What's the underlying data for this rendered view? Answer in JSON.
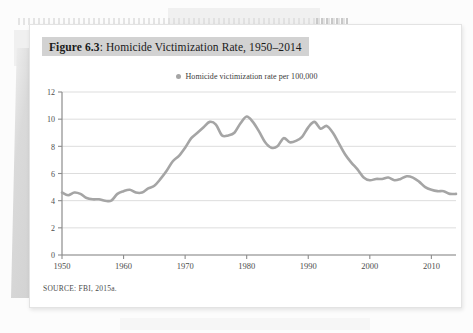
{
  "figure": {
    "label": "Figure 6.3",
    "title_rest": ": Homicide Victimization Rate, 1950–2014",
    "source": "SOURCE: FBI, 2015a."
  },
  "legend": {
    "marker": "circle-marker",
    "text": "Homicide victimization rate per 100,000"
  },
  "colors": {
    "line": "#a5a5a5",
    "grid": "#d9d9d9",
    "axis": "#8c8c8c",
    "title_band": "#d2d2d2",
    "card": "#ffffff",
    "page": "#fcfcfc"
  },
  "chart_data": {
    "type": "line",
    "title": "Figure 6.3: Homicide Victimization Rate, 1950–2014",
    "xlabel": "",
    "ylabel": "",
    "ylim": [
      0,
      12
    ],
    "xlim": [
      1950,
      2014
    ],
    "yticks": [
      0,
      2,
      4,
      6,
      8,
      10,
      12
    ],
    "xticks": [
      1950,
      1960,
      1970,
      1980,
      1990,
      2000,
      2010
    ],
    "grid": true,
    "legend_position": "top-center",
    "series": [
      {
        "name": "Homicide victimization rate per 100,000",
        "x": [
          1950,
          1951,
          1952,
          1953,
          1954,
          1955,
          1956,
          1957,
          1958,
          1959,
          1960,
          1961,
          1962,
          1963,
          1964,
          1965,
          1966,
          1967,
          1968,
          1969,
          1970,
          1971,
          1972,
          1973,
          1974,
          1975,
          1976,
          1977,
          1978,
          1979,
          1980,
          1981,
          1982,
          1983,
          1984,
          1985,
          1986,
          1987,
          1988,
          1989,
          1990,
          1991,
          1992,
          1993,
          1994,
          1995,
          1996,
          1997,
          1998,
          1999,
          2000,
          2001,
          2002,
          2003,
          2004,
          2005,
          2006,
          2007,
          2008,
          2009,
          2010,
          2011,
          2012,
          2013,
          2014
        ],
        "values": [
          4.6,
          4.4,
          4.6,
          4.5,
          4.2,
          4.1,
          4.1,
          4.0,
          4.0,
          4.5,
          4.7,
          4.8,
          4.6,
          4.6,
          4.9,
          5.1,
          5.6,
          6.2,
          6.9,
          7.3,
          7.9,
          8.6,
          9.0,
          9.4,
          9.8,
          9.6,
          8.8,
          8.8,
          9.0,
          9.7,
          10.2,
          9.8,
          9.1,
          8.3,
          7.9,
          8.0,
          8.6,
          8.3,
          8.4,
          8.7,
          9.4,
          9.8,
          9.3,
          9.5,
          9.0,
          8.2,
          7.4,
          6.8,
          6.3,
          5.7,
          5.5,
          5.6,
          5.6,
          5.7,
          5.5,
          5.6,
          5.8,
          5.7,
          5.4,
          5.0,
          4.8,
          4.7,
          4.7,
          4.5,
          4.5
        ]
      }
    ]
  }
}
